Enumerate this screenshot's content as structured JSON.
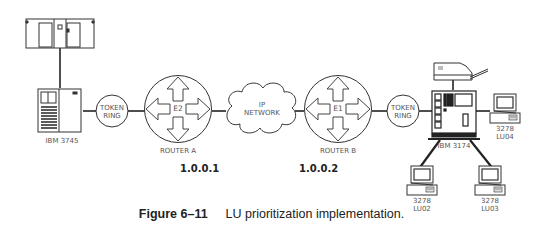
{
  "diagram": {
    "nodes": {
      "mainframe": {
        "label": ""
      },
      "ibm3745": {
        "label": "IBM 3745"
      },
      "token_ring_left": {
        "line1": "TOKEN",
        "line2": "RING"
      },
      "router_a": {
        "label": "ROUTER A",
        "interface": "E2",
        "ip": "1.0.0.1"
      },
      "ip_network": {
        "line1": "IP",
        "line2": "NETWORK"
      },
      "router_b": {
        "label": "ROUTER B",
        "interface": "E1",
        "ip": "1.0.0.2"
      },
      "token_ring_right": {
        "line1": "TOKEN",
        "line2": "RING"
      },
      "ibm3174": {
        "label": "IBM 3174"
      },
      "printer": {
        "label": ""
      },
      "terminal_lu04": {
        "model": "3278",
        "lu": "LU04"
      },
      "terminal_lu02": {
        "model": "3278",
        "lu": "LU02"
      },
      "terminal_lu03": {
        "model": "3278",
        "lu": "LU03"
      }
    },
    "edges": [
      [
        "mainframe",
        "ibm3745"
      ],
      [
        "ibm3745",
        "token_ring_left"
      ],
      [
        "token_ring_left",
        "router_a"
      ],
      [
        "router_a",
        "ip_network"
      ],
      [
        "ip_network",
        "router_b"
      ],
      [
        "router_b",
        "token_ring_right"
      ],
      [
        "token_ring_right",
        "ibm3174"
      ],
      [
        "printer",
        "ibm3174"
      ],
      [
        "ibm3174",
        "terminal_lu04"
      ],
      [
        "ibm3174",
        "terminal_lu02"
      ],
      [
        "ibm3174",
        "terminal_lu03"
      ]
    ]
  },
  "caption": {
    "figure_number": "Figure 6–11",
    "text": "LU prioritization implementation."
  }
}
